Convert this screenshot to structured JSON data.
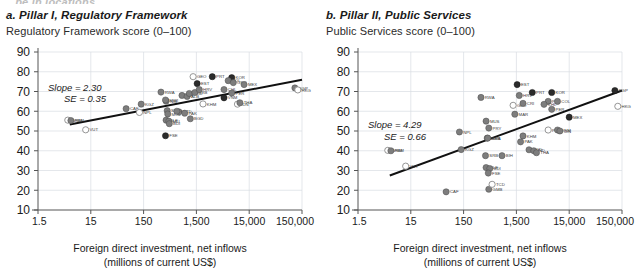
{
  "figure": {
    "clipped_heading": "…be in locations"
  },
  "panels": [
    {
      "id": "a",
      "title": "a. Pillar I, Regulatory Framework",
      "subtitle": "Regulatory Framework score (0–100)",
      "slope_label": "Slope = 2.30",
      "se_label": "SE = 0.35",
      "axis_title_line1": "Foreign direct investment, net inflows",
      "axis_title_line2": "(millions of current US$)"
    },
    {
      "id": "b",
      "title": "b. Pillar II, Public Services",
      "subtitle": "Public Services score (0–100)",
      "slope_label": "Slope = 4.29",
      "se_label": "SE = 0.66",
      "axis_title_line1": "Foreign direct investment, net inflows",
      "axis_title_line2": "(millions of current US$)"
    }
  ],
  "chart_data": [
    {
      "type": "scatter",
      "panel": "a",
      "title": "a. Pillar I, Regulatory Framework",
      "ylabel": "Regulatory Framework score (0–100)",
      "xlabel": "Foreign direct investment, net inflows (millions of current US$)",
      "xscale": "log",
      "xlim": [
        1.5,
        150000
      ],
      "ylim": [
        10,
        90
      ],
      "xticks": [
        1.5,
        15,
        150,
        1500,
        15000,
        150000
      ],
      "xticklabels": [
        "1.5",
        "15",
        "150",
        "1,500",
        "15,000",
        "150,000"
      ],
      "yticks": [
        10,
        20,
        30,
        40,
        50,
        60,
        70,
        80,
        90
      ],
      "grid": true,
      "legend": "none",
      "fit": {
        "slope": 2.3,
        "se": 0.35,
        "x0": 6,
        "y0": 53.3,
        "x1": 150000,
        "y1": 76.0
      },
      "points": [
        {
          "code": "WSM",
          "x": 5.5,
          "y": 55.5,
          "style": "light"
        },
        {
          "code": "FSM",
          "x": 6.3,
          "y": 55.3,
          "style": "mid"
        },
        {
          "code": "VUT",
          "x": 12.0,
          "y": 50.6,
          "style": "light"
        },
        {
          "code": "CAF",
          "x": 70.0,
          "y": 61.3,
          "style": "mid"
        },
        {
          "code": "KGZ",
          "x": 135.0,
          "y": 63.6,
          "style": "mid"
        },
        {
          "code": "NPL",
          "x": 125.0,
          "y": 59.4,
          "style": "light"
        },
        {
          "code": "RWA",
          "x": 320.0,
          "y": 69.7,
          "style": "mid"
        },
        {
          "code": "NIB",
          "x": 400.0,
          "y": 65.1,
          "style": "mid"
        },
        {
          "code": "MWI",
          "x": 390.0,
          "y": 65.7,
          "style": "mid"
        },
        {
          "code": "SEN",
          "x": 420.0,
          "y": 60.3,
          "style": "mid"
        },
        {
          "code": "MOZ",
          "x": 430.0,
          "y": 58.6,
          "style": "mid"
        },
        {
          "code": "SLE",
          "x": 400.0,
          "y": 55.5,
          "style": "mid"
        },
        {
          "code": "MLI",
          "x": 450.0,
          "y": 55.0,
          "style": "mid"
        },
        {
          "code": "BDI",
          "x": 460.0,
          "y": 53.7,
          "style": "mid"
        },
        {
          "code": "FSE",
          "x": 390.0,
          "y": 47.6,
          "style": "dark"
        },
        {
          "code": "TCD",
          "x": 700.0,
          "y": 59.7,
          "style": "mid"
        },
        {
          "code": "CIV",
          "x": 640.0,
          "y": 60.0,
          "style": "mid"
        },
        {
          "code": "PAK",
          "x": 900.0,
          "y": 59.0,
          "style": "mid"
        },
        {
          "code": "BGD",
          "x": 1150.0,
          "y": 56.2,
          "style": "mid"
        },
        {
          "code": "GEO",
          "x": 1300.0,
          "y": 77.5,
          "style": "light"
        },
        {
          "code": "EST",
          "x": 1550.0,
          "y": 74.0,
          "style": "dark"
        },
        {
          "code": "BIH",
          "x": 800.0,
          "y": 68.0,
          "style": "mid"
        },
        {
          "code": "ALB",
          "x": 1000.0,
          "y": 67.5,
          "style": "mid"
        },
        {
          "code": "MKD",
          "x": 1100.0,
          "y": 69.0,
          "style": "mid"
        },
        {
          "code": "SRB",
          "x": 1400.0,
          "y": 69.5,
          "style": "mid"
        },
        {
          "code": "HRV",
          "x": 1700.0,
          "y": 71.0,
          "style": "mid"
        },
        {
          "code": "PRT",
          "x": 3000.0,
          "y": 77.5,
          "style": "dark"
        },
        {
          "code": "KOR",
          "x": 7000.0,
          "y": 77.0,
          "style": "dark"
        },
        {
          "code": "POL",
          "x": 6000.0,
          "y": 75.5,
          "style": "mid"
        },
        {
          "code": "GRC",
          "x": 7500.0,
          "y": 74.5,
          "style": "mid"
        },
        {
          "code": "MEX",
          "x": 12000.0,
          "y": 73.5,
          "style": "mid"
        },
        {
          "code": "CHL",
          "x": 5000.0,
          "y": 71.0,
          "style": "mid"
        },
        {
          "code": "PER",
          "x": 7000.0,
          "y": 69.2,
          "style": "mid"
        },
        {
          "code": "KHM",
          "x": 2000.0,
          "y": 63.7,
          "style": "light"
        },
        {
          "code": "VNM",
          "x": 5000.0,
          "y": 66.8,
          "style": "dark"
        },
        {
          "code": "IDN",
          "x": 9000.0,
          "y": 63.6,
          "style": "light"
        },
        {
          "code": "THA",
          "x": 10000.0,
          "y": 64.3,
          "style": "mid"
        },
        {
          "code": "SGP",
          "x": 110000.0,
          "y": 71.8,
          "style": "mid"
        },
        {
          "code": "HKG",
          "x": 125000.0,
          "y": 70.8,
          "style": "light"
        }
      ]
    },
    {
      "type": "scatter",
      "panel": "b",
      "title": "b. Pillar II, Public Services",
      "ylabel": "Public Services score (0–100)",
      "xlabel": "Foreign direct investment, net inflows (millions of current US$)",
      "xscale": "log",
      "xlim": [
        1.5,
        150000
      ],
      "ylim": [
        10,
        90
      ],
      "xticks": [
        1.5,
        15,
        150,
        1500,
        15000,
        150000
      ],
      "xticklabels": [
        "1.5",
        "15",
        "150",
        "1,500",
        "15,000",
        "150,000"
      ],
      "yticks": [
        10,
        20,
        30,
        40,
        50,
        60,
        70,
        80,
        90
      ],
      "grid": true,
      "legend": "none",
      "fit": {
        "slope": 4.29,
        "se": 0.66,
        "x0": 6,
        "y0": 27.5,
        "x1": 150000,
        "y1": 70.5
      },
      "points": [
        {
          "code": "WSM",
          "x": 5.5,
          "y": 40.2,
          "style": "light"
        },
        {
          "code": "FSM",
          "x": 6.3,
          "y": 40.0,
          "style": "mid"
        },
        {
          "code": "VUT",
          "x": 12.0,
          "y": 32.2,
          "style": "light"
        },
        {
          "code": "CAF",
          "x": 70.0,
          "y": 19.2,
          "style": "mid"
        },
        {
          "code": "KGZ",
          "x": 135.0,
          "y": 40.6,
          "style": "mid"
        },
        {
          "code": "NPL",
          "x": 125.0,
          "y": 49.5,
          "style": "mid"
        },
        {
          "code": "RWA",
          "x": 320.0,
          "y": 67.0,
          "style": "mid"
        },
        {
          "code": "MUS",
          "x": 400.0,
          "y": 55.0,
          "style": "mid"
        },
        {
          "code": "PRY",
          "x": 450.0,
          "y": 51.5,
          "style": "mid"
        },
        {
          "code": "BWA",
          "x": 420.0,
          "y": 46.4,
          "style": "mid"
        },
        {
          "code": "SEN",
          "x": 430.0,
          "y": 46.4,
          "style": "mid"
        },
        {
          "code": "SRB",
          "x": 390.0,
          "y": 37.5,
          "style": "mid"
        },
        {
          "code": "SLE",
          "x": 400.0,
          "y": 31.5,
          "style": "mid"
        },
        {
          "code": "BDI",
          "x": 470.0,
          "y": 31.0,
          "style": "mid"
        },
        {
          "code": "FSE",
          "x": 440.0,
          "y": 28.7,
          "style": "mid"
        },
        {
          "code": "GMB",
          "x": 450.0,
          "y": 20.5,
          "style": "mid"
        },
        {
          "code": "TCD",
          "x": 520.0,
          "y": 23.0,
          "style": "light"
        },
        {
          "code": "BIH",
          "x": 800.0,
          "y": 37.5,
          "style": "mid"
        },
        {
          "code": "GEO",
          "x": 1300.0,
          "y": 63.0,
          "style": "light"
        },
        {
          "code": "MAR",
          "x": 1400.0,
          "y": 58.5,
          "style": "mid"
        },
        {
          "code": "EST",
          "x": 1550.0,
          "y": 73.5,
          "style": "dark"
        },
        {
          "code": "HRV",
          "x": 1700.0,
          "y": 68.0,
          "style": "mid"
        },
        {
          "code": "CRI",
          "x": 2000.0,
          "y": 64.0,
          "style": "mid"
        },
        {
          "code": "PRT",
          "x": 3000.0,
          "y": 69.5,
          "style": "dark"
        },
        {
          "code": "KOR",
          "x": 7000.0,
          "y": 69.5,
          "style": "dark"
        },
        {
          "code": "POL",
          "x": 6000.0,
          "y": 65.0,
          "style": "mid"
        },
        {
          "code": "COL",
          "x": 9000.0,
          "y": 65.0,
          "style": "mid"
        },
        {
          "code": "CHL",
          "x": 5000.0,
          "y": 63.5,
          "style": "mid"
        },
        {
          "code": "PER",
          "x": 7000.0,
          "y": 61.0,
          "style": "mid"
        },
        {
          "code": "PHL",
          "x": 6000.0,
          "y": 50.5,
          "style": "light"
        },
        {
          "code": "VNM",
          "x": 9000.0,
          "y": 50.5,
          "style": "mid"
        },
        {
          "code": "IDN",
          "x": 10000.0,
          "y": 50.0,
          "style": "mid"
        },
        {
          "code": "MEX",
          "x": 15000.0,
          "y": 57.0,
          "style": "dark"
        },
        {
          "code": "KHM",
          "x": 2000.0,
          "y": 47.5,
          "style": "mid"
        },
        {
          "code": "PAK",
          "x": 1800.0,
          "y": 44.5,
          "style": "mid"
        },
        {
          "code": "BGD",
          "x": 2600.0,
          "y": 40.5,
          "style": "mid"
        },
        {
          "code": "IND",
          "x": 3200.0,
          "y": 40.0,
          "style": "mid"
        },
        {
          "code": "THA",
          "x": 3600.0,
          "y": 39.0,
          "style": "mid"
        },
        {
          "code": "SGP",
          "x": 110000.0,
          "y": 70.5,
          "style": "dark"
        },
        {
          "code": "HKG",
          "x": 125000.0,
          "y": 62.5,
          "style": "light"
        }
      ]
    }
  ]
}
